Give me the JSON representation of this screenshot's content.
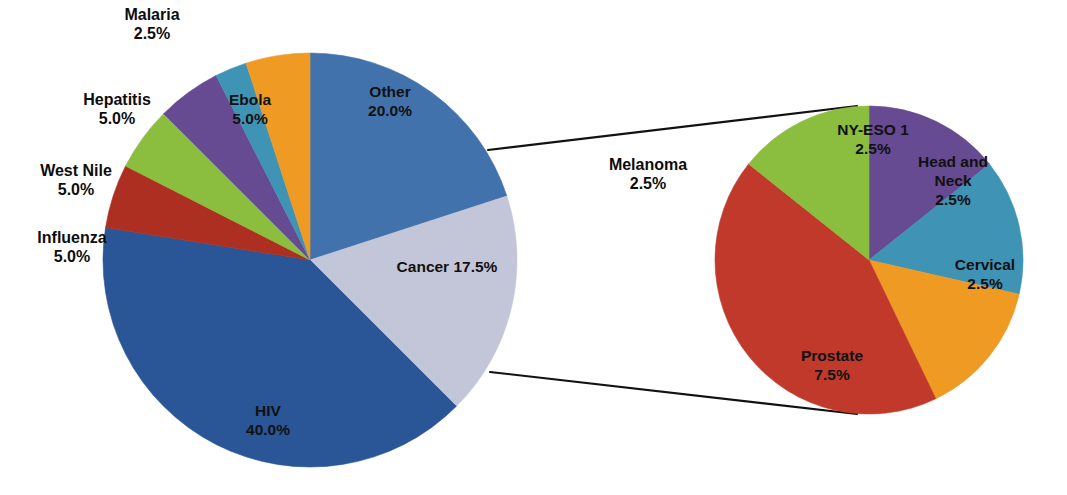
{
  "figure": {
    "background_color": "#ffffff",
    "width": 1067,
    "height": 495,
    "label_text_color": "#111111",
    "callout_line_color": "#111111"
  },
  "chart_data": [
    {
      "type": "pie",
      "name": "disease-distribution-pie",
      "title": "",
      "xlabel": "",
      "ylabel": "",
      "legend": "none",
      "grid": false,
      "center_px": [
        310,
        260
      ],
      "radius_px": 207,
      "start_angle_deg": 0,
      "direction": "clockwise",
      "categories": [
        "Other",
        "Cancer",
        "HIV",
        "Influenza",
        "West Nile",
        "Hepatitis",
        "Malaria",
        "Ebola"
      ],
      "values": [
        20.0,
        17.5,
        40.0,
        5.0,
        5.0,
        5.0,
        2.5,
        5.0
      ],
      "unit": "%",
      "colors": [
        "#4272ac",
        "#c3c6d8",
        "#2a5596",
        "#ad2f22",
        "#8bbd3f",
        "#664a92",
        "#3f93b5",
        "#ef9a23"
      ],
      "slices": [
        {
          "label": "Other",
          "value": 20.0,
          "value_text": "20.0%",
          "label_text": "Other",
          "color": "#4272ac",
          "label_placement": "inside",
          "label_px": [
            390,
            102
          ]
        },
        {
          "label": "Cancer",
          "value": 17.5,
          "value_text": "17.5%",
          "label_text": "Cancer 17.5%",
          "color": "#c3c6d8",
          "label_placement": "inside",
          "label_px": [
            447,
            268
          ],
          "single_line": true
        },
        {
          "label": "HIV",
          "value": 40.0,
          "value_text": "40.0%",
          "label_text": "HIV",
          "color": "#2a5596",
          "label_placement": "inside",
          "label_px": [
            268,
            421
          ]
        },
        {
          "label": "Influenza",
          "value": 5.0,
          "value_text": "5.0%",
          "label_text": "Influenza",
          "color": "#ad2f22",
          "label_placement": "outside",
          "label_px": [
            72,
            248
          ]
        },
        {
          "label": "West Nile",
          "value": 5.0,
          "value_text": "5.0%",
          "label_text": "West Nile",
          "color": "#8bbd3f",
          "label_placement": "outside",
          "label_px": [
            76,
            181
          ]
        },
        {
          "label": "Hepatitis",
          "value": 5.0,
          "value_text": "5.0%",
          "label_text": "Hepatitis",
          "color": "#664a92",
          "label_placement": "outside",
          "label_px": [
            117,
            110
          ]
        },
        {
          "label": "Malaria",
          "value": 2.5,
          "value_text": "2.5%",
          "label_text": "Malaria",
          "color": "#3f93b5",
          "label_placement": "outside",
          "label_px": [
            152,
            25
          ]
        },
        {
          "label": "Ebola",
          "value": 5.0,
          "value_text": "5.0%",
          "label_text": "Ebola",
          "color": "#ef9a23",
          "label_placement": "inside",
          "label_px": [
            250,
            110
          ]
        }
      ]
    },
    {
      "type": "pie",
      "name": "cancer-breakout-pie",
      "title": "",
      "xlabel": "",
      "ylabel": "",
      "legend": "none",
      "grid": false,
      "center_px": [
        869,
        260
      ],
      "radius_px": 154,
      "start_angle_deg": 0,
      "direction": "clockwise",
      "categories": [
        "NY-ESO 1",
        "Head and Neck",
        "Cervical",
        "Prostate",
        "Melanoma"
      ],
      "values": [
        2.5,
        2.5,
        2.5,
        7.5,
        2.5
      ],
      "unit": "%",
      "colors": [
        "#664a92",
        "#3f93b5",
        "#ef9a23",
        "#c0392b",
        "#8bbd3f"
      ],
      "slices": [
        {
          "label": "NY-ESO 1",
          "value": 2.5,
          "value_text": "2.5%",
          "label_text": "NY-ESO 1",
          "color": "#664a92",
          "label_placement": "inside",
          "label_px": [
            873,
            140
          ]
        },
        {
          "label": "Head and Neck",
          "value": 2.5,
          "value_text": "2.5%",
          "label_text": "Head and Neck",
          "color": "#3f93b5",
          "label_placement": "inside",
          "label_px": [
            953,
            182
          ],
          "wrap": [
            "Head and",
            "Neck"
          ]
        },
        {
          "label": "Cervical",
          "value": 2.5,
          "value_text": "2.5%",
          "label_text": "Cervical",
          "color": "#ef9a23",
          "label_placement": "inside",
          "label_px": [
            985,
            275
          ]
        },
        {
          "label": "Prostate",
          "value": 7.5,
          "value_text": "7.5%",
          "label_text": "Prostate",
          "color": "#c0392b",
          "label_placement": "inside",
          "label_px": [
            832,
            366
          ]
        },
        {
          "label": "Melanoma",
          "value": 2.5,
          "value_text": "2.5%",
          "label_text": "Melanoma",
          "color": "#8bbd3f",
          "label_placement": "outside",
          "label_px": [
            648,
            175
          ]
        }
      ]
    }
  ],
  "callouts": [
    {
      "name": "cancer-breakout-upper-connector",
      "from_px": [
        488,
        150
      ],
      "to_px": [
        857,
        106
      ]
    },
    {
      "name": "cancer-breakout-lower-connector",
      "from_px": [
        490,
        372
      ],
      "to_px": [
        857,
        414
      ]
    }
  ]
}
